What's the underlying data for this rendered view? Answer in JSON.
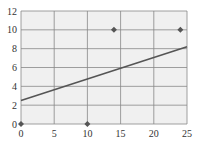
{
  "chart_data": {
    "type": "scatter",
    "title": "",
    "xlabel": "",
    "ylabel": "",
    "xlim": [
      0,
      25
    ],
    "ylim": [
      0,
      12
    ],
    "grid": true,
    "x_ticks": [
      "0",
      "5",
      "10",
      "15",
      "20",
      "25"
    ],
    "y_ticks": [
      "0",
      "2",
      "4",
      "6",
      "8",
      "10",
      "12"
    ],
    "series": [
      {
        "name": "points",
        "type": "scatter",
        "x": [
          0,
          10,
          14,
          24
        ],
        "y": [
          0,
          0,
          10,
          10
        ]
      },
      {
        "name": "fit line",
        "type": "line",
        "x": [
          0,
          25
        ],
        "y": [
          2.5,
          8.2
        ]
      }
    ],
    "colors": {
      "background": "#f0f0f0",
      "grid": "#888888",
      "points": "#555555",
      "line": "#555555"
    }
  }
}
